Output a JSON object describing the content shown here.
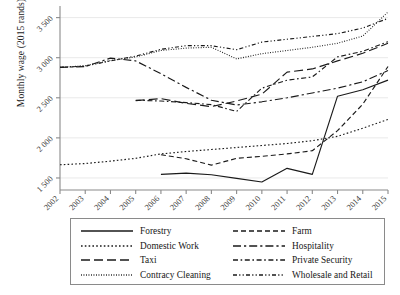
{
  "chart_data": {
    "type": "line",
    "title": "",
    "xlabel": "",
    "ylabel": "Monthly wage (2015 rands)",
    "ylim": [
      1350,
      3620
    ],
    "xlim": [
      2002,
      2015
    ],
    "grid": "horizontal",
    "legend_position": "bottom",
    "x_ticks": [
      "2002",
      "2003",
      "2004",
      "2005",
      "2006",
      "2007",
      "2008",
      "2009",
      "2010",
      "2011",
      "2012",
      "2013",
      "2014",
      "2015"
    ],
    "y_ticks": [
      "1 500",
      "2 000",
      "2 500",
      "3 000",
      "3 500"
    ],
    "y_tick_values": [
      1500,
      2000,
      2500,
      3000,
      3500
    ],
    "series": [
      {
        "name": "Forestry",
        "style": "solid",
        "x": [
          2006,
          2007,
          2008,
          2009,
          2010,
          2011,
          2012,
          2013,
          2014,
          2015
        ],
        "values": [
          1545,
          1560,
          1540,
          1495,
          1450,
          1620,
          1545,
          2520,
          2600,
          2720
        ]
      },
      {
        "name": "Domestic Work",
        "style": "dotted",
        "x": [
          2002,
          2003,
          2004,
          2005,
          2006,
          2007,
          2008,
          2009,
          2010,
          2011,
          2012,
          2013,
          2014,
          2015
        ],
        "values": [
          1665,
          1680,
          1710,
          1745,
          1800,
          1830,
          1855,
          1880,
          1905,
          1930,
          1965,
          2020,
          2120,
          2230
        ]
      },
      {
        "name": "Taxi",
        "style": "dashed-long",
        "x": [
          2005,
          2006,
          2007,
          2008,
          2009,
          2010,
          2011,
          2012,
          2013,
          2014,
          2015
        ],
        "values": [
          2465,
          2490,
          2430,
          2390,
          2460,
          2545,
          2820,
          2860,
          2960,
          3055,
          3180
        ]
      },
      {
        "name": "Contracy Cleaning",
        "style": "fine-dotted",
        "x": [
          2002,
          2003,
          2004,
          2005,
          2006,
          2007,
          2008,
          2009,
          2010,
          2011,
          2012,
          2013,
          2014,
          2015
        ],
        "values": [
          2880,
          2900,
          2965,
          3010,
          3090,
          3120,
          3130,
          2985,
          3050,
          3090,
          3130,
          3180,
          3270,
          3570
        ]
      },
      {
        "name": "Farm",
        "style": "dashed",
        "x": [
          2006,
          2007,
          2008,
          2009,
          2010,
          2011,
          2012,
          2013,
          2014,
          2015
        ],
        "values": [
          1790,
          1740,
          1660,
          1745,
          1770,
          1800,
          1840,
          2090,
          2420,
          2890
        ]
      },
      {
        "name": "Hospitality",
        "style": "dash-dot",
        "x": [
          2002,
          2003,
          2004,
          2005,
          2006,
          2007,
          2008,
          2009,
          2010,
          2011,
          2012,
          2013,
          2014,
          2015
        ],
        "values": [
          2880,
          2890,
          2995,
          2960,
          2800,
          2630,
          2470,
          2410,
          2450,
          2500,
          2560,
          2620,
          2700,
          2840
        ]
      },
      {
        "name": "Private Security",
        "style": "dash-dot-short",
        "x": [
          2005,
          2006,
          2007,
          2008,
          2009,
          2010,
          2011,
          2012,
          2013,
          2014,
          2015
        ],
        "values": [
          2470,
          2460,
          2440,
          2415,
          2330,
          2620,
          2720,
          2760,
          3010,
          3080,
          3200
        ]
      },
      {
        "name": "Wholesale and Retail",
        "style": "dash-dot-dot",
        "x": [
          2002,
          2003,
          2004,
          2005,
          2006,
          2007,
          2008,
          2009,
          2010,
          2011,
          2012,
          2013,
          2014,
          2015
        ],
        "values": [
          2880,
          2895,
          2960,
          3020,
          3105,
          3150,
          3150,
          3100,
          3195,
          3230,
          3265,
          3300,
          3370,
          3490
        ]
      }
    ]
  },
  "legend": {
    "items": [
      {
        "label": "Forestry",
        "style": "solid"
      },
      {
        "label": "Farm",
        "style": "dashed"
      },
      {
        "label": "Domestic Work",
        "style": "dotted"
      },
      {
        "label": "Hospitality",
        "style": "dash-dot"
      },
      {
        "label": "Taxi",
        "style": "dashed-long"
      },
      {
        "label": "Private Security",
        "style": "dash-dot-short"
      },
      {
        "label": "Contracy Cleaning",
        "style": "fine-dotted"
      },
      {
        "label": "Wholesale and Retail",
        "style": "dash-dot-dot"
      }
    ]
  },
  "colors": {
    "line": "#1a1a1a",
    "axis": "#8a8a8a",
    "grid": "#e9e9e9",
    "text": "#1a1a1a",
    "background": "#ffffff"
  }
}
